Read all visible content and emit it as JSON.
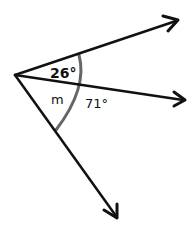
{
  "diagram": {
    "type": "angles",
    "vertex": {
      "x": 15,
      "y": 75
    },
    "rays": [
      {
        "name": "ray-top",
        "end": {
          "x": 178,
          "y": 20
        }
      },
      {
        "name": "ray-middle",
        "end": {
          "x": 185,
          "y": 100
        }
      },
      {
        "name": "ray-bottom",
        "end": {
          "x": 117,
          "y": 218
        }
      }
    ],
    "labels": {
      "top_angle": "26°",
      "unknown_angle": "m",
      "total_angle": "71°"
    },
    "colors": {
      "ray": "#111111",
      "arc": "#666666"
    }
  }
}
